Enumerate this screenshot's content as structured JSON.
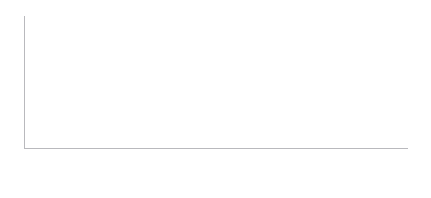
{
  "title_strip": "（占GDP百分比，到2060年的累计增幅）",
  "legend": {
    "items": [
      {
        "label": "老龄化",
        "key": "swatch-dark",
        "color": "#767679"
      },
      {
        "label": "附加成本增长",
        "key": "swatch-light",
        "color": "#e6e6e6"
      },
      {
        "label": "未加权平均值",
        "key": "line-solid",
        "color": "#54545a"
      },
      {
        "label": "加权平均值",
        "key": "line-dashed",
        "color": "#3d3d42"
      }
    ]
  },
  "chart_data": {
    "type": "bar",
    "title": "",
    "xlabel": "",
    "ylabel": "",
    "ylim": [
      0,
      6
    ],
    "yticks": [
      0,
      1,
      2,
      3,
      4,
      5,
      6
    ],
    "ytick_labels": [
      "0",
      "1",
      "2",
      "3",
      "4",
      "5",
      "6"
    ],
    "grid": false,
    "stacked": true,
    "legend_position": "top-right",
    "categories": [
      "美国",
      "卢森堡",
      "瑞典",
      "捷克",
      "意大利",
      "爱尔兰",
      "斯洛文尼亚",
      "丹麦",
      "德国",
      "日本",
      "斯洛伐克",
      "芬兰",
      "西班牙",
      "挪威",
      "匈牙利",
      "比利时",
      "澳大利亚",
      "荷兰",
      "英国",
      "葡萄牙",
      "冰岛",
      "希腊",
      "韩国",
      "奥地利",
      "法国",
      "爱沙尼亚",
      "瑞士"
    ],
    "series": [
      {
        "name": "附加成本增长",
        "color": "#e6e6e6",
        "values": [
          3.78,
          3.6,
          3.17,
          2.62,
          3.0,
          2.12,
          2.25,
          2.52,
          2.1,
          2.0,
          1.7,
          1.72,
          1.3,
          1.3,
          1.05,
          1.05,
          0.95,
          0.6,
          0.4,
          0.0,
          0.0,
          0.15,
          0.0,
          0.0,
          0.0,
          0.0,
          0.0
        ]
      },
      {
        "name": "老龄化",
        "color": "#767679",
        "values": [
          1.27,
          0.42,
          0.68,
          0.88,
          0.3,
          1.14,
          1.01,
          0.62,
          1.05,
          1.02,
          0.88,
          0.75,
          0.85,
          0.75,
          0.97,
          0.67,
          0.67,
          0.92,
          0.85,
          0.99,
          0.96,
          0.7,
          0.8,
          0.77,
          0.7,
          0.65,
          0.5
        ]
      }
    ],
    "totals": [
      5.05,
      4.02,
      3.85,
      3.5,
      3.3,
      3.26,
      3.26,
      3.14,
      3.15,
      3.02,
      2.58,
      2.47,
      2.15,
      2.05,
      2.02,
      1.72,
      1.62,
      1.52,
      1.25,
      0.99,
      0.96,
      0.85,
      0.8,
      0.77,
      0.7,
      0.65,
      0.5
    ],
    "reference_lines": [
      {
        "name": "未加权平均值",
        "value": 2.22,
        "style": "solid",
        "color": "#54545a"
      },
      {
        "name": "加权平均值",
        "value": 3.1,
        "style": "dashed",
        "color": "#3d3d42"
      }
    ]
  }
}
